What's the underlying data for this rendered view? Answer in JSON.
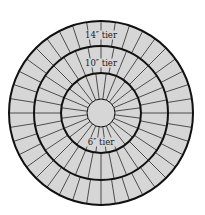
{
  "diagram": {
    "center": {
      "x": 101,
      "y": 113
    },
    "colors": {
      "background": "#ffffff",
      "fill": "#d6d6d6",
      "ring_stroke": "#111111",
      "spoke_stroke": "#2a2a2a"
    },
    "center_circle_radius": 14,
    "tiers": [
      {
        "label": "6″ tier",
        "inner_radius": 14,
        "outer_radius": 40,
        "slices": 24,
        "label_x": 101,
        "label_y": 145
      },
      {
        "label": "10″ tier",
        "inner_radius": 40,
        "outer_radius": 67,
        "slices": 32,
        "label_x": 101,
        "label_y": 66
      },
      {
        "label": "14″ tier",
        "inner_radius": 67,
        "outer_radius": 92,
        "slices": 40,
        "label_x": 101,
        "label_y": 38
      }
    ]
  }
}
